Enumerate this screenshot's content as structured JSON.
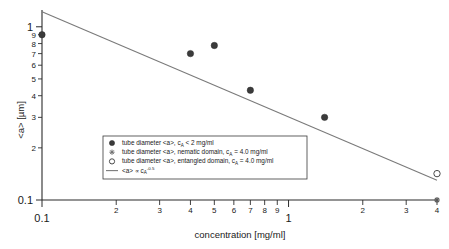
{
  "chart_data": {
    "type": "scatter",
    "title": "",
    "xlabel": "concentration [mg/ml]",
    "ylabel": "<a> [µm]",
    "xscale": "log",
    "yscale": "log",
    "xlim": [
      0.1,
      4.0
    ],
    "ylim": [
      0.1,
      1.25
    ],
    "grid": false,
    "legend_position": "center-left",
    "x_major_ticks": [
      {
        "value": 0.1,
        "label": "0.1"
      },
      {
        "value": 1.0,
        "label": "1"
      }
    ],
    "x_minor_ticks": [
      {
        "value": 0.2,
        "label": "2"
      },
      {
        "value": 0.3,
        "label": "3"
      },
      {
        "value": 0.4,
        "label": "4"
      },
      {
        "value": 0.5,
        "label": "5"
      },
      {
        "value": 0.6,
        "label": "6"
      },
      {
        "value": 0.7,
        "label": "7"
      },
      {
        "value": 0.8,
        "label": "8"
      },
      {
        "value": 0.9,
        "label": "9"
      },
      {
        "value": 2.0,
        "label": "2"
      },
      {
        "value": 3.0,
        "label": "3"
      },
      {
        "value": 4.0,
        "label": "4"
      }
    ],
    "y_major_ticks": [
      {
        "value": 1.0,
        "label": "1"
      },
      {
        "value": 0.1,
        "label": "0.1"
      }
    ],
    "y_minor_ticks": [
      {
        "value": 0.9,
        "label": "9"
      },
      {
        "value": 0.8,
        "label": "8"
      },
      {
        "value": 0.7,
        "label": "7"
      },
      {
        "value": 0.6,
        "label": "6"
      },
      {
        "value": 0.5,
        "label": "5"
      },
      {
        "value": 0.4,
        "label": "4"
      },
      {
        "value": 0.3,
        "label": "3"
      },
      {
        "value": 0.2,
        "label": "2"
      }
    ],
    "series": [
      {
        "name": "tube diameter <a>, c_A < 2 mg/ml",
        "marker": "filled-circle",
        "points": [
          {
            "x": 0.1,
            "y": 0.9
          },
          {
            "x": 0.4,
            "y": 0.7
          },
          {
            "x": 0.5,
            "y": 0.78
          },
          {
            "x": 0.7,
            "y": 0.43
          },
          {
            "x": 1.4,
            "y": 0.3
          }
        ]
      },
      {
        "name": "tube diameter <a>, nematic domain, c_A = 4.0 mg/ml",
        "marker": "star",
        "points": [
          {
            "x": 4.0,
            "y": 0.1
          }
        ]
      },
      {
        "name": "tube diameter <a>, entangled domain, c_A = 4.0 mg/ml",
        "marker": "open-circle",
        "points": [
          {
            "x": 4.0,
            "y": 0.142
          }
        ]
      }
    ],
    "fit": {
      "name": "<a> ∝ c_A^-0.5",
      "exponent": -0.5,
      "x_start": 0.1,
      "y_start": 1.22,
      "x_end": 4.0,
      "y_end": 0.13
    },
    "colors": {
      "axis": "#2b2b2b",
      "fit_line": "#7a7a7a",
      "filled_marker": "#3b3b3b",
      "open_marker": "#ffffff",
      "background": "#ffffff"
    }
  },
  "legend": {
    "entries": [
      {
        "marker": "filled-circle",
        "prefix": "tube diameter <a>, c",
        "sub": "A",
        "suffix": " < 2 mg/ml"
      },
      {
        "marker": "star",
        "prefix": "tube diameter <a>, nematic domain, c",
        "sub": "A",
        "suffix": " = 4.0 mg/ml"
      },
      {
        "marker": "open-circle",
        "prefix": "tube diameter <a>, entangled domain, c",
        "sub": "A",
        "suffix": " = 4.0 mg/ml"
      },
      {
        "marker": "line",
        "prefix": "<a> ∝ c",
        "sub": "A",
        "sup": "-0.5",
        "suffix": ""
      }
    ]
  },
  "axes": {
    "x_title": "concentration [mg/ml]",
    "y_title": "<a> [µm]"
  }
}
